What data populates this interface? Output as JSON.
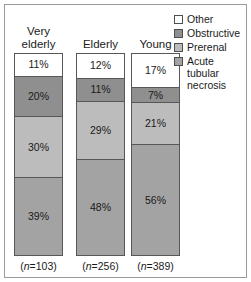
{
  "chart_data": {
    "type": "bar",
    "subtype": "stacked-100-percent",
    "title": "",
    "xlabel": "",
    "ylabel": "",
    "ylim": [
      0,
      100
    ],
    "grid": false,
    "legend_position": "top-right",
    "categories": [
      "Very\nelderly",
      "Elderly",
      "Young"
    ],
    "category_counts": [
      "(n=103)",
      "(n=256)",
      "(n=389)"
    ],
    "series": [
      {
        "name": "Other",
        "color": "#ffffff",
        "values": [
          11,
          12,
          17
        ],
        "labels": [
          "11%",
          "12%",
          "17%"
        ]
      },
      {
        "name": "Obstructive",
        "color": "#8f8f8f",
        "values": [
          20,
          11,
          7
        ],
        "labels": [
          "20%",
          "11%",
          "7%"
        ]
      },
      {
        "name": "Prerenal",
        "color": "#bcbcbc",
        "values": [
          30,
          29,
          21
        ],
        "labels": [
          "30%",
          "29%",
          "21%"
        ]
      },
      {
        "name": "Acute tubular necrosis",
        "color": "#a3a3a3",
        "values": [
          39,
          48,
          56
        ],
        "labels": [
          "39%",
          "48%",
          "56%"
        ]
      }
    ]
  },
  "columns": [
    {
      "title": "Very\nelderly",
      "n_prefix": "(",
      "n_italic": "n",
      "n_value": "=103)",
      "n_full": "(n=103)",
      "segments": [
        {
          "label": "11%",
          "name": "Other"
        },
        {
          "label": "20%",
          "name": "Obstructive"
        },
        {
          "label": "30%",
          "name": "Prerenal"
        },
        {
          "label": "39%",
          "name": "Acute tubular necrosis"
        }
      ]
    },
    {
      "title": "Elderly",
      "n_prefix": "(",
      "n_italic": "n",
      "n_value": "=256)",
      "n_full": "(n=256)",
      "segments": [
        {
          "label": "12%",
          "name": "Other"
        },
        {
          "label": "11%",
          "name": "Obstructive"
        },
        {
          "label": "29%",
          "name": "Prerenal"
        },
        {
          "label": "48%",
          "name": "Acute tubular necrosis"
        }
      ]
    },
    {
      "title": "Young",
      "n_prefix": "(",
      "n_italic": "n",
      "n_value": "=389)",
      "n_full": "(n=389)",
      "segments": [
        {
          "label": "17%",
          "name": "Other"
        },
        {
          "label": "7%",
          "name": "Obstructive"
        },
        {
          "label": "21%",
          "name": "Prerenal"
        },
        {
          "label": "56%",
          "name": "Acute tubular necrosis"
        }
      ]
    }
  ],
  "legend": {
    "items": [
      {
        "label": "Other",
        "color": "#ffffff"
      },
      {
        "label": "Obstructive",
        "color": "#8f8f8f"
      },
      {
        "label": "Prerenal",
        "color": "#bcbcbc"
      },
      {
        "label": "Acute tubular\nnecrosis",
        "color": "#a3a3a3"
      }
    ]
  },
  "style": {
    "border_color": "#9a9a9a",
    "segment_border": "#575757",
    "text_color": "#1a1a1a"
  }
}
